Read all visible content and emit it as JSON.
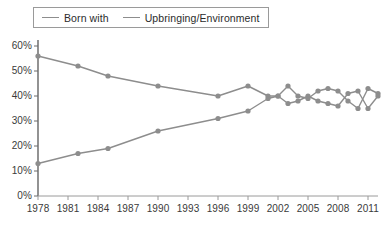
{
  "chart_data": {
    "type": "line",
    "title": "",
    "xlabel": "",
    "ylabel": "",
    "ylim": [
      0,
      60
    ],
    "xlim": [
      1978,
      2012
    ],
    "grid": false,
    "legend_position": "top-left",
    "ytick_labels": [
      "60%",
      "50%",
      "40%",
      "30%",
      "20%",
      "10%",
      "0%"
    ],
    "ytick_values": [
      60,
      50,
      40,
      30,
      20,
      10,
      0
    ],
    "xtick_labels": [
      "1978",
      "1981",
      "1984",
      "1987",
      "1990",
      "1993",
      "1996",
      "1999",
      "2002",
      "2005",
      "2008",
      "2011"
    ],
    "xtick_values": [
      1978,
      1981,
      1984,
      1987,
      1990,
      1993,
      1996,
      1999,
      2002,
      2005,
      2008,
      2011
    ],
    "series": [
      {
        "name": "Born with",
        "color": "#8d8d8d",
        "x": [
          1978,
          1982,
          1985,
          1990,
          1996,
          1999,
          2001,
          2002,
          2003,
          2004,
          2005,
          2006,
          2007,
          2008,
          2009,
          2010,
          2011,
          2012
        ],
        "values": [
          56,
          52,
          48,
          44,
          40,
          44,
          40,
          40,
          44,
          40,
          39,
          42,
          43,
          42,
          38,
          35,
          43,
          41
        ]
      },
      {
        "name": "Upbringing/Environment",
        "color": "#8d8d8d",
        "x": [
          1978,
          1982,
          1985,
          1990,
          1996,
          1999,
          2001,
          2002,
          2003,
          2004,
          2005,
          2006,
          2007,
          2008,
          2009,
          2010,
          2011,
          2012
        ],
        "values": [
          13,
          17,
          19,
          26,
          31,
          34,
          39,
          40,
          37,
          38,
          40,
          38,
          37,
          36,
          41,
          42,
          35,
          40
        ]
      }
    ]
  },
  "legend": {
    "entries": [
      {
        "label": "Born with"
      },
      {
        "label": "Upbringing/Environment"
      }
    ]
  }
}
